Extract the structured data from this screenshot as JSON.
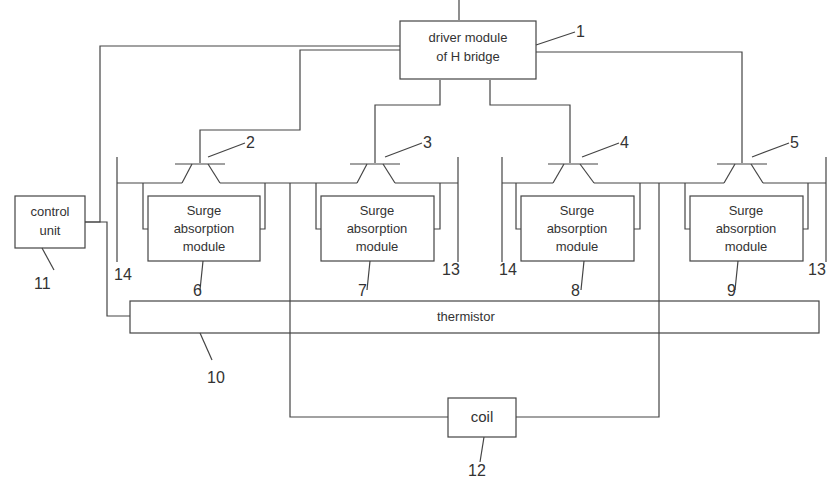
{
  "diagram": {
    "blocks": {
      "driver": {
        "line1": "driver module",
        "line2": "of H bridge",
        "ref": "1"
      },
      "control": {
        "line1": "control",
        "line2": "unit",
        "ref": "11"
      },
      "surge": [
        {
          "line1": "Surge",
          "line2": "absorption",
          "line3": "module",
          "ref": "6"
        },
        {
          "line1": "Surge",
          "line2": "absorption",
          "line3": "module",
          "ref": "7"
        },
        {
          "line1": "Surge",
          "line2": "absorption",
          "line3": "module",
          "ref": "8"
        },
        {
          "line1": "Surge",
          "line2": "absorption",
          "line3": "module",
          "ref": "9"
        }
      ],
      "thermistor": {
        "label": "thermistor",
        "ref": "10"
      },
      "coil": {
        "label": "coil",
        "ref": "12"
      }
    },
    "transistors": [
      {
        "ref": "2"
      },
      {
        "ref": "3"
      },
      {
        "ref": "4"
      },
      {
        "ref": "5"
      }
    ],
    "rails": {
      "left_a": "14",
      "right_a": "13",
      "left_b": "14",
      "right_b": "13"
    }
  }
}
